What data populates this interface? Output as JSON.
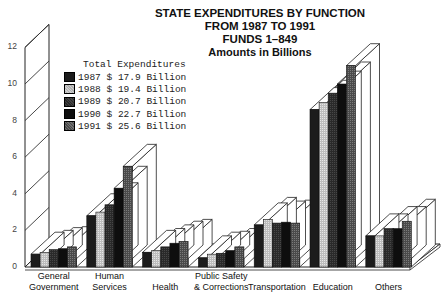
{
  "chart_data": {
    "type": "bar",
    "title": "STATE EXPENDITURES BY FUNCTION",
    "title_lines": [
      "STATE EXPENDITURES BY FUNCTION",
      "FROM 1987 TO 1991",
      "FUNDS 1–849",
      "Amounts in Billions"
    ],
    "xlabel": "",
    "ylabel": "Amounts in Billions",
    "ylim": [
      0,
      12
    ],
    "yticks": [
      0,
      2,
      4,
      6,
      8,
      10,
      12
    ],
    "grid": false,
    "style": "3d-grouped",
    "categories": [
      "General Government",
      "Human Services",
      "Health",
      "Public Safety & Corrections",
      "Transportation",
      "Education",
      "Others"
    ],
    "category_label_lines": [
      [
        "General",
        "Government"
      ],
      [
        "Human",
        "Services"
      ],
      [
        "Health"
      ],
      [
        "Public Safety",
        "& Corrections"
      ],
      [
        "Transportation"
      ],
      [
        "Education"
      ],
      [
        "Others"
      ]
    ],
    "legend_title": "Total Expenditures",
    "legend_position": "upper-left",
    "series": [
      {
        "name": "1987",
        "total": "$ 17.9 Billion",
        "color": "#1c1c1c",
        "values": [
          0.7,
          2.8,
          0.8,
          0.5,
          2.3,
          8.6,
          1.7
        ]
      },
      {
        "name": "1988",
        "total": "$ 19.4 Billion",
        "color": "#c4c4c4",
        "values": [
          0.8,
          3.0,
          0.9,
          0.7,
          2.6,
          9.0,
          1.7
        ]
      },
      {
        "name": "1989",
        "total": "$ 20.7 Billion",
        "color": "#303030",
        "values": [
          0.95,
          3.4,
          1.1,
          0.75,
          2.4,
          9.5,
          2.1
        ]
      },
      {
        "name": "1990",
        "total": "$ 22.7 Billion",
        "color": "#0e0e0e",
        "values": [
          1.0,
          4.3,
          1.3,
          0.9,
          2.45,
          10.0,
          2.1
        ]
      },
      {
        "name": "1991",
        "total": "$ 25.6 Billion",
        "color": "#555555",
        "values": [
          1.1,
          5.5,
          1.4,
          1.1,
          2.4,
          11.0,
          2.5
        ]
      }
    ]
  }
}
